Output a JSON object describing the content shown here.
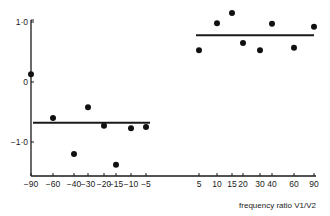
{
  "chart_data": {
    "type": "scatter",
    "title": "",
    "xlabel": "frequency ratio V1/V2",
    "ylabel": "",
    "ylim": [
      -1.6,
      1.0
    ],
    "grid": false,
    "legend": null,
    "y_ticks": [
      "1·0",
      "0",
      "−1·0"
    ],
    "x_ticks_left": [
      "−90",
      "−60",
      "−40",
      "−30",
      "−20",
      "−15",
      "−10",
      "−5"
    ],
    "x_ticks_right": [
      "5",
      "10",
      "15",
      "20",
      "30",
      "40",
      "60",
      "90"
    ],
    "series": [
      {
        "name": "negative ratios",
        "x": [
          -90,
          -60,
          -40,
          -30,
          -20,
          -15,
          -10,
          -5
        ],
        "y": [
          0.13,
          -0.6,
          -1.2,
          -0.42,
          -0.73,
          -1.38,
          -0.77,
          -0.75
        ],
        "mean_line": -0.68
      },
      {
        "name": "positive ratios",
        "x": [
          5,
          10,
          15,
          20,
          30,
          40,
          60,
          90
        ],
        "y": [
          0.53,
          0.98,
          1.15,
          0.65,
          0.53,
          0.97,
          0.57,
          0.92
        ],
        "mean_line": 0.78
      }
    ]
  }
}
